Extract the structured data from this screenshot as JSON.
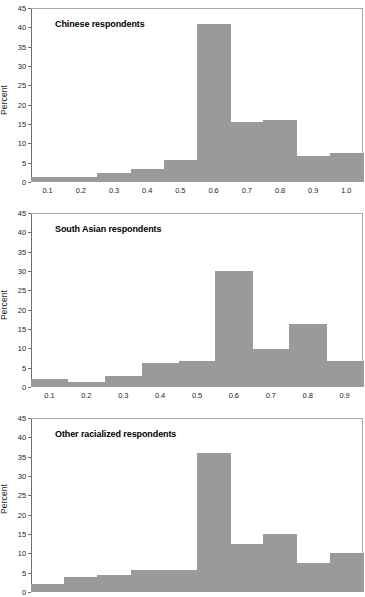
{
  "figure": {
    "ylabel": "Percent",
    "bar_color": "#999a9b",
    "axis_color": "#6d6e71",
    "background": "#ffffff"
  },
  "chart_data": [
    {
      "type": "bar",
      "title": "Chinese respondents",
      "xlabel": "",
      "ylabel": "Percent",
      "ylim": [
        0,
        45
      ],
      "yticks": [
        0,
        5,
        10,
        15,
        20,
        25,
        30,
        35,
        40,
        45
      ],
      "xlim": [
        0.05,
        1.05
      ],
      "xticks": [
        0.1,
        0.2,
        0.3,
        0.4,
        0.5,
        0.6,
        0.7,
        0.8,
        0.9,
        1.0
      ],
      "xtick_labels": [
        "0.1",
        "0.2",
        "0.3",
        "0.4",
        "0.5",
        "0.6",
        "0.7",
        "0.8",
        "0.9",
        "1.0"
      ],
      "grid": false,
      "bin_width": 0.05,
      "bin_edges": [
        0.05,
        0.1,
        0.15,
        0.2,
        0.25,
        0.3,
        0.35,
        0.4,
        0.45,
        0.5,
        0.55,
        0.6,
        0.65,
        0.7,
        0.75,
        0.8,
        0.85,
        0.9,
        0.95,
        1.0,
        1.05
      ],
      "categories": [
        "0.05-0.10",
        "0.10-0.15",
        "0.15-0.20",
        "0.20-0.25",
        "0.25-0.30",
        "0.30-0.35",
        "0.35-0.40",
        "0.40-0.45",
        "0.45-0.50",
        "0.50-0.55",
        "0.55-0.60",
        "0.60-0.65",
        "0.65-0.70",
        "0.70-0.75",
        "0.75-0.80",
        "0.80-0.85",
        "0.85-0.90",
        "0.90-0.95",
        "0.95-1.00",
        "1.00-1.05"
      ],
      "values": [
        1.2,
        1.2,
        1.2,
        1.2,
        2.3,
        2.3,
        3.3,
        3.3,
        5.8,
        5.8,
        40.8,
        40.8,
        15.6,
        15.6,
        16.0,
        16.0,
        6.8,
        6.8,
        7.4,
        7.4
      ]
    },
    {
      "type": "bar",
      "title": "South Asian respondents",
      "xlabel": "",
      "ylabel": "Percent",
      "ylim": [
        0,
        45
      ],
      "yticks": [
        0,
        5,
        10,
        15,
        20,
        25,
        30,
        35,
        40,
        45
      ],
      "xlim": [
        0.05,
        0.95
      ],
      "xticks": [
        0.1,
        0.2,
        0.3,
        0.4,
        0.5,
        0.6,
        0.7,
        0.8,
        0.9
      ],
      "xtick_labels": [
        "0.1",
        "0.2",
        "0.3",
        "0.4",
        "0.5",
        "0.6",
        "0.7",
        "0.8",
        "0.9"
      ],
      "grid": false,
      "bin_width": 0.05,
      "bin_edges": [
        0.05,
        0.1,
        0.15,
        0.2,
        0.25,
        0.3,
        0.35,
        0.4,
        0.45,
        0.5,
        0.55,
        0.6,
        0.65,
        0.7,
        0.75,
        0.8,
        0.85,
        0.9,
        0.95
      ],
      "categories": [
        "0.05-0.10",
        "0.10-0.15",
        "0.15-0.20",
        "0.20-0.25",
        "0.25-0.30",
        "0.30-0.35",
        "0.35-0.40",
        "0.40-0.45",
        "0.45-0.50",
        "0.50-0.55",
        "0.55-0.60",
        "0.60-0.65",
        "0.65-0.70",
        "0.70-0.75",
        "0.75-0.80",
        "0.80-0.85",
        "0.85-0.90",
        "0.90-0.95"
      ],
      "values": [
        2.1,
        2.1,
        1.4,
        1.4,
        2.8,
        2.8,
        6.2,
        6.2,
        6.6,
        6.6,
        29.9,
        29.9,
        9.8,
        9.8,
        16.2,
        16.2,
        6.6,
        6.6
      ]
    },
    {
      "type": "bar",
      "title": "Other racialized respondents",
      "xlabel": "",
      "ylabel": "Percent",
      "ylim": [
        0,
        45
      ],
      "yticks": [
        0,
        5,
        10,
        15,
        20,
        25,
        30,
        35,
        40,
        45
      ],
      "xlim": [
        0.05,
        1.05
      ],
      "xticks": [],
      "xtick_labels": [],
      "grid": false,
      "bin_width": 0.05,
      "bin_edges": [
        0.05,
        0.1,
        0.15,
        0.2,
        0.25,
        0.3,
        0.35,
        0.4,
        0.45,
        0.5,
        0.55,
        0.6,
        0.65,
        0.7,
        0.75,
        0.8,
        0.85,
        0.9,
        0.95,
        1.0,
        1.05
      ],
      "categories": [
        "0.05-0.10",
        "0.10-0.15",
        "0.15-0.20",
        "0.20-0.25",
        "0.25-0.30",
        "0.30-0.35",
        "0.35-0.40",
        "0.40-0.45",
        "0.45-0.50",
        "0.50-0.55",
        "0.55-0.60",
        "0.60-0.65",
        "0.65-0.70",
        "0.70-0.75",
        "0.75-0.80",
        "0.80-0.85",
        "0.85-0.90",
        "0.90-0.95",
        "0.95-1.00",
        "1.00-1.05"
      ],
      "values": [
        2.2,
        2.2,
        4.0,
        4.0,
        4.5,
        4.5,
        5.6,
        5.6,
        5.6,
        5.6,
        36.0,
        36.0,
        12.5,
        12.5,
        15.0,
        15.0,
        7.6,
        7.6,
        10.0,
        10.0
      ]
    }
  ]
}
